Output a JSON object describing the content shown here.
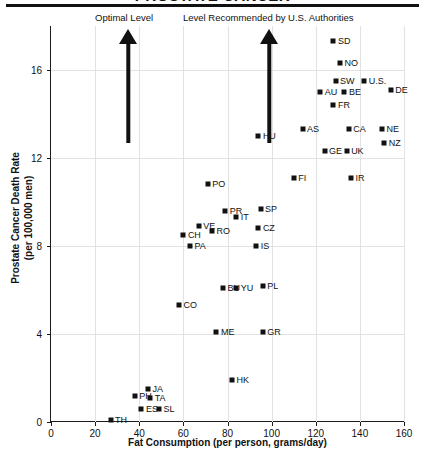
{
  "figure": {
    "title": "PROSTATE CANCER",
    "annotations": [
      {
        "label": "Optimal Level",
        "x_value": 35
      },
      {
        "label": "Level Recommended by U.S. Authorities",
        "x_value": 99
      }
    ]
  },
  "chart_data": {
    "type": "scatter",
    "title": "PROSTATE CANCER",
    "xlabel": "Fat Consumption (per person, grams/day)",
    "ylabel": "Prostate Cancer Death Rate (per 100,000 men)",
    "xlim": [
      0,
      160
    ],
    "ylim": [
      0,
      18
    ],
    "xticks": [
      0,
      20,
      40,
      60,
      80,
      100,
      120,
      140,
      160
    ],
    "yticks": [
      0,
      4,
      8,
      12,
      16
    ],
    "grid": true,
    "legend": "none",
    "marker": "filled-square",
    "marker_color": "#111111",
    "points": [
      {
        "label": "SD",
        "x": 128,
        "y": 17.3,
        "lab_pos": "right"
      },
      {
        "label": "NO",
        "x": 131,
        "y": 16.3,
        "lab_pos": "right"
      },
      {
        "label": "SW",
        "x": 129,
        "y": 15.5,
        "lab_pos": "right"
      },
      {
        "label": "U.S.",
        "x": 142,
        "y": 15.5,
        "lab_pos": "right"
      },
      {
        "label": "DE",
        "x": 154,
        "y": 15.1,
        "lab_pos": "right"
      },
      {
        "label": "AU",
        "x": 122,
        "y": 15.0,
        "lab_pos": "right"
      },
      {
        "label": "BE",
        "x": 133,
        "y": 15.0,
        "lab_pos": "right"
      },
      {
        "label": "FR",
        "x": 128,
        "y": 14.4,
        "lab_pos": "right"
      },
      {
        "label": "AS",
        "x": 114,
        "y": 13.3,
        "lab_pos": "right"
      },
      {
        "label": "CA",
        "x": 135,
        "y": 13.3,
        "lab_pos": "right"
      },
      {
        "label": "NE",
        "x": 150,
        "y": 13.3,
        "lab_pos": "right"
      },
      {
        "label": "NZ",
        "x": 151,
        "y": 12.7,
        "lab_pos": "right"
      },
      {
        "label": "HU",
        "x": 94,
        "y": 13.0,
        "lab_pos": "right"
      },
      {
        "label": "GE",
        "x": 124,
        "y": 12.3,
        "lab_pos": "right"
      },
      {
        "label": "UK",
        "x": 134,
        "y": 12.3,
        "lab_pos": "right"
      },
      {
        "label": "FI",
        "x": 110,
        "y": 11.1,
        "lab_pos": "right"
      },
      {
        "label": "IR",
        "x": 136,
        "y": 11.1,
        "lab_pos": "right"
      },
      {
        "label": "PO",
        "x": 71,
        "y": 10.8,
        "lab_pos": "right"
      },
      {
        "label": "PR",
        "x": 79,
        "y": 9.6,
        "lab_pos": "right"
      },
      {
        "label": "SP",
        "x": 95,
        "y": 9.7,
        "lab_pos": "right"
      },
      {
        "label": "IT",
        "x": 84,
        "y": 9.3,
        "lab_pos": "right"
      },
      {
        "label": "VE",
        "x": 67,
        "y": 8.9,
        "lab_pos": "right"
      },
      {
        "label": "RO",
        "x": 73,
        "y": 8.7,
        "lab_pos": "right"
      },
      {
        "label": "CZ",
        "x": 94,
        "y": 8.8,
        "lab_pos": "right"
      },
      {
        "label": "CH",
        "x": 60,
        "y": 8.5,
        "lab_pos": "right"
      },
      {
        "label": "PA",
        "x": 63,
        "y": 8.0,
        "lab_pos": "right"
      },
      {
        "label": "IS",
        "x": 93,
        "y": 8.0,
        "lab_pos": "right"
      },
      {
        "label": "BU",
        "x": 78,
        "y": 6.1,
        "lab_pos": "right"
      },
      {
        "label": "YU",
        "x": 84,
        "y": 6.1,
        "lab_pos": "right"
      },
      {
        "label": "PL",
        "x": 96,
        "y": 6.2,
        "lab_pos": "right"
      },
      {
        "label": "CO",
        "x": 58,
        "y": 5.3,
        "lab_pos": "right"
      },
      {
        "label": "ME",
        "x": 75,
        "y": 4.1,
        "lab_pos": "right"
      },
      {
        "label": "GR",
        "x": 96,
        "y": 4.1,
        "lab_pos": "right"
      },
      {
        "label": "HK",
        "x": 82,
        "y": 1.9,
        "lab_pos": "right"
      },
      {
        "label": "JA",
        "x": 44,
        "y": 1.5,
        "lab_pos": "right"
      },
      {
        "label": "PH",
        "x": 38,
        "y": 1.2,
        "lab_pos": "right"
      },
      {
        "label": "TA",
        "x": 45,
        "y": 1.1,
        "lab_pos": "right"
      },
      {
        "label": "ES",
        "x": 41,
        "y": 0.6,
        "lab_pos": "right"
      },
      {
        "label": "SL",
        "x": 49,
        "y": 0.6,
        "lab_pos": "right"
      },
      {
        "label": "TH",
        "x": 27,
        "y": 0.1,
        "lab_pos": "right"
      }
    ]
  }
}
